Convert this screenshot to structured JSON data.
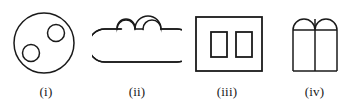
{
  "panel": {
    "width": 357,
    "height": 109,
    "background_color": "#ffffff",
    "stroke_color": "#1a1a1a",
    "stroke_width": 1.5,
    "fill": "none",
    "description": "Four outline line-drawing figures arranged left to right, each captioned with a lowercase roman numeral in parentheses."
  },
  "figures": [
    {
      "id": "figure-i",
      "label": "(i)",
      "name": "circle-with-two-inner-circles",
      "shapes": [
        {
          "type": "circle",
          "name": "outer-circle",
          "cx": 44,
          "cy": 43,
          "r": 30
        },
        {
          "type": "circle",
          "name": "inner-circle-upper-right",
          "cx": 56,
          "cy": 33,
          "r": 8.5
        },
        {
          "type": "circle",
          "name": "inner-circle-lower-left",
          "cx": 31,
          "cy": 53,
          "r": 8.5
        }
      ]
    },
    {
      "id": "figure-ii",
      "label": "(ii)",
      "name": "stadium-with-two-top-circles",
      "shapes": [
        {
          "type": "stadium",
          "name": "stadium-body",
          "x": 105,
          "y": 29,
          "width": 72,
          "height": 33,
          "radius": 16.5
        },
        {
          "type": "circle",
          "name": "top-circle-left",
          "cx": 126,
          "cy": 29,
          "r": 9
        },
        {
          "type": "circle",
          "name": "top-circle-right",
          "cx": 152,
          "cy": 29,
          "r": 9
        },
        {
          "type": "line",
          "name": "connector-line",
          "x1": 135,
          "y1": 29,
          "x2": 143,
          "y2": 29
        }
      ]
    },
    {
      "id": "figure-iii",
      "label": "(iii)",
      "name": "rectangle-with-two-inner-rectangles",
      "shapes": [
        {
          "type": "rect",
          "name": "outer-rectangle",
          "x": 196,
          "y": 17,
          "width": 66,
          "height": 54
        },
        {
          "type": "rect",
          "name": "inner-rectangle-left",
          "x": 211,
          "y": 32,
          "width": 16,
          "height": 25
        },
        {
          "type": "rect",
          "name": "inner-rectangle-right",
          "x": 236,
          "y": 32,
          "width": 16,
          "height": 25
        }
      ]
    },
    {
      "id": "figure-iv",
      "label": "(iv)",
      "name": "two-adjoining-arches",
      "shapes": [
        {
          "type": "arch",
          "name": "arch-left",
          "x": 293,
          "y": 19,
          "width": 22,
          "height": 52,
          "arch_height": 11
        },
        {
          "type": "arch",
          "name": "arch-right",
          "x": 315,
          "y": 19,
          "width": 22,
          "height": 52,
          "arch_height": 11
        },
        {
          "type": "line",
          "name": "spring-line",
          "x1": 293,
          "y1": 30,
          "x2": 337,
          "y2": 30
        },
        {
          "type": "line",
          "name": "center-divider",
          "x1": 315,
          "y1": 19,
          "x2": 315,
          "y2": 71
        }
      ]
    }
  ]
}
